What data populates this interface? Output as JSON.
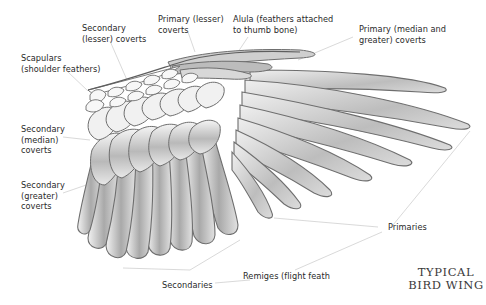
{
  "diagram": {
    "title_line1": "TYPICAL",
    "title_line2": "BIRD WING",
    "labels": [
      {
        "id": "secondary-lesser-coverts",
        "line1": "Secondary",
        "line2": "(lesser) coverts"
      },
      {
        "id": "primary-lesser-coverts",
        "line1": "Primary (lesser)",
        "line2": "coverts"
      },
      {
        "id": "alula",
        "line1": "Alula (feathers attached",
        "line2": "to thumb bone)"
      },
      {
        "id": "primary-median-greater-coverts",
        "line1": "Primary (median and",
        "line2": "greater) coverts"
      },
      {
        "id": "scapulars",
        "line1": "Scapulars",
        "line2": "(shoulder feathers)"
      },
      {
        "id": "secondary-median-coverts",
        "line1": "Secondary",
        "line2": "(median)",
        "line3": "coverts"
      },
      {
        "id": "secondary-greater-coverts",
        "line1": "Secondary",
        "line2": "(greater)",
        "line3": "coverts"
      },
      {
        "id": "primaries",
        "line1": "Primaries"
      },
      {
        "id": "secondaries",
        "line1": "Secondaries"
      },
      {
        "id": "remiges",
        "line1": "Remiges (flight feath"
      }
    ],
    "colors": {
      "outline": "#6e6e6e",
      "shade_dark": "#9a9a9a",
      "shade_light": "#e6e6e6",
      "leader": "#c8c8c8",
      "text": "#2a2a2a"
    }
  }
}
